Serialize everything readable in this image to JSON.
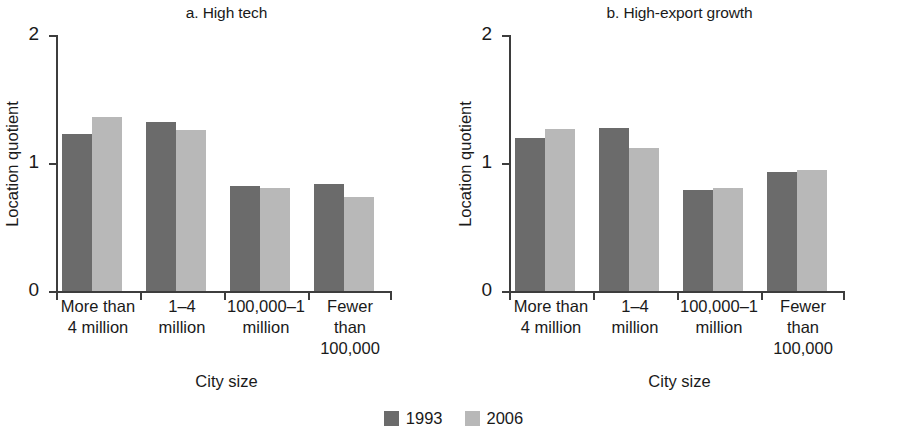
{
  "chart_data": [
    {
      "type": "bar",
      "title": "a. High tech",
      "xlabel": "City size",
      "ylabel": "Location quotient",
      "ylim": [
        0,
        2
      ],
      "yticks": [
        0,
        1,
        2
      ],
      "ytick_labels": [
        "0",
        "1",
        "2"
      ],
      "grid": false,
      "legend_position": "bottom-center-shared",
      "categories": [
        [
          "More than",
          "4 million"
        ],
        [
          "1–4",
          "million"
        ],
        [
          "100,000–1",
          "million"
        ],
        [
          "Fewer",
          "than",
          "100,000"
        ]
      ],
      "category_labels": [
        "More than 4 million",
        "1–4 million",
        "100,000–1 million",
        "Fewer than 100,000"
      ],
      "series": [
        {
          "name": "1993",
          "color": "#6b6b6b",
          "values": [
            1.23,
            1.32,
            0.82,
            0.84
          ]
        },
        {
          "name": "2006",
          "color": "#b8b8b8",
          "values": [
            1.36,
            1.26,
            0.81,
            0.74
          ]
        }
      ]
    },
    {
      "type": "bar",
      "title": "b. High-export growth",
      "xlabel": "City size",
      "ylabel": "Location quotient",
      "ylim": [
        0,
        2
      ],
      "yticks": [
        0,
        1,
        2
      ],
      "ytick_labels": [
        "0",
        "1",
        "2"
      ],
      "grid": false,
      "legend_position": "bottom-center-shared",
      "categories": [
        [
          "More than",
          "4 million"
        ],
        [
          "1–4",
          "million"
        ],
        [
          "100,000–1",
          "million"
        ],
        [
          "Fewer",
          "than",
          "100,000"
        ]
      ],
      "category_labels": [
        "More than 4 million",
        "1–4 million",
        "100,000–1 million",
        "Fewer than 100,000"
      ],
      "series": [
        {
          "name": "1993",
          "color": "#6b6b6b",
          "values": [
            1.2,
            1.28,
            0.79,
            0.93
          ]
        },
        {
          "name": "2006",
          "color": "#b8b8b8",
          "values": [
            1.27,
            1.12,
            0.81,
            0.95
          ]
        }
      ]
    }
  ],
  "legend": {
    "items": [
      {
        "label": "1993",
        "color": "#6b6b6b"
      },
      {
        "label": "2006",
        "color": "#b8b8b8"
      }
    ]
  }
}
